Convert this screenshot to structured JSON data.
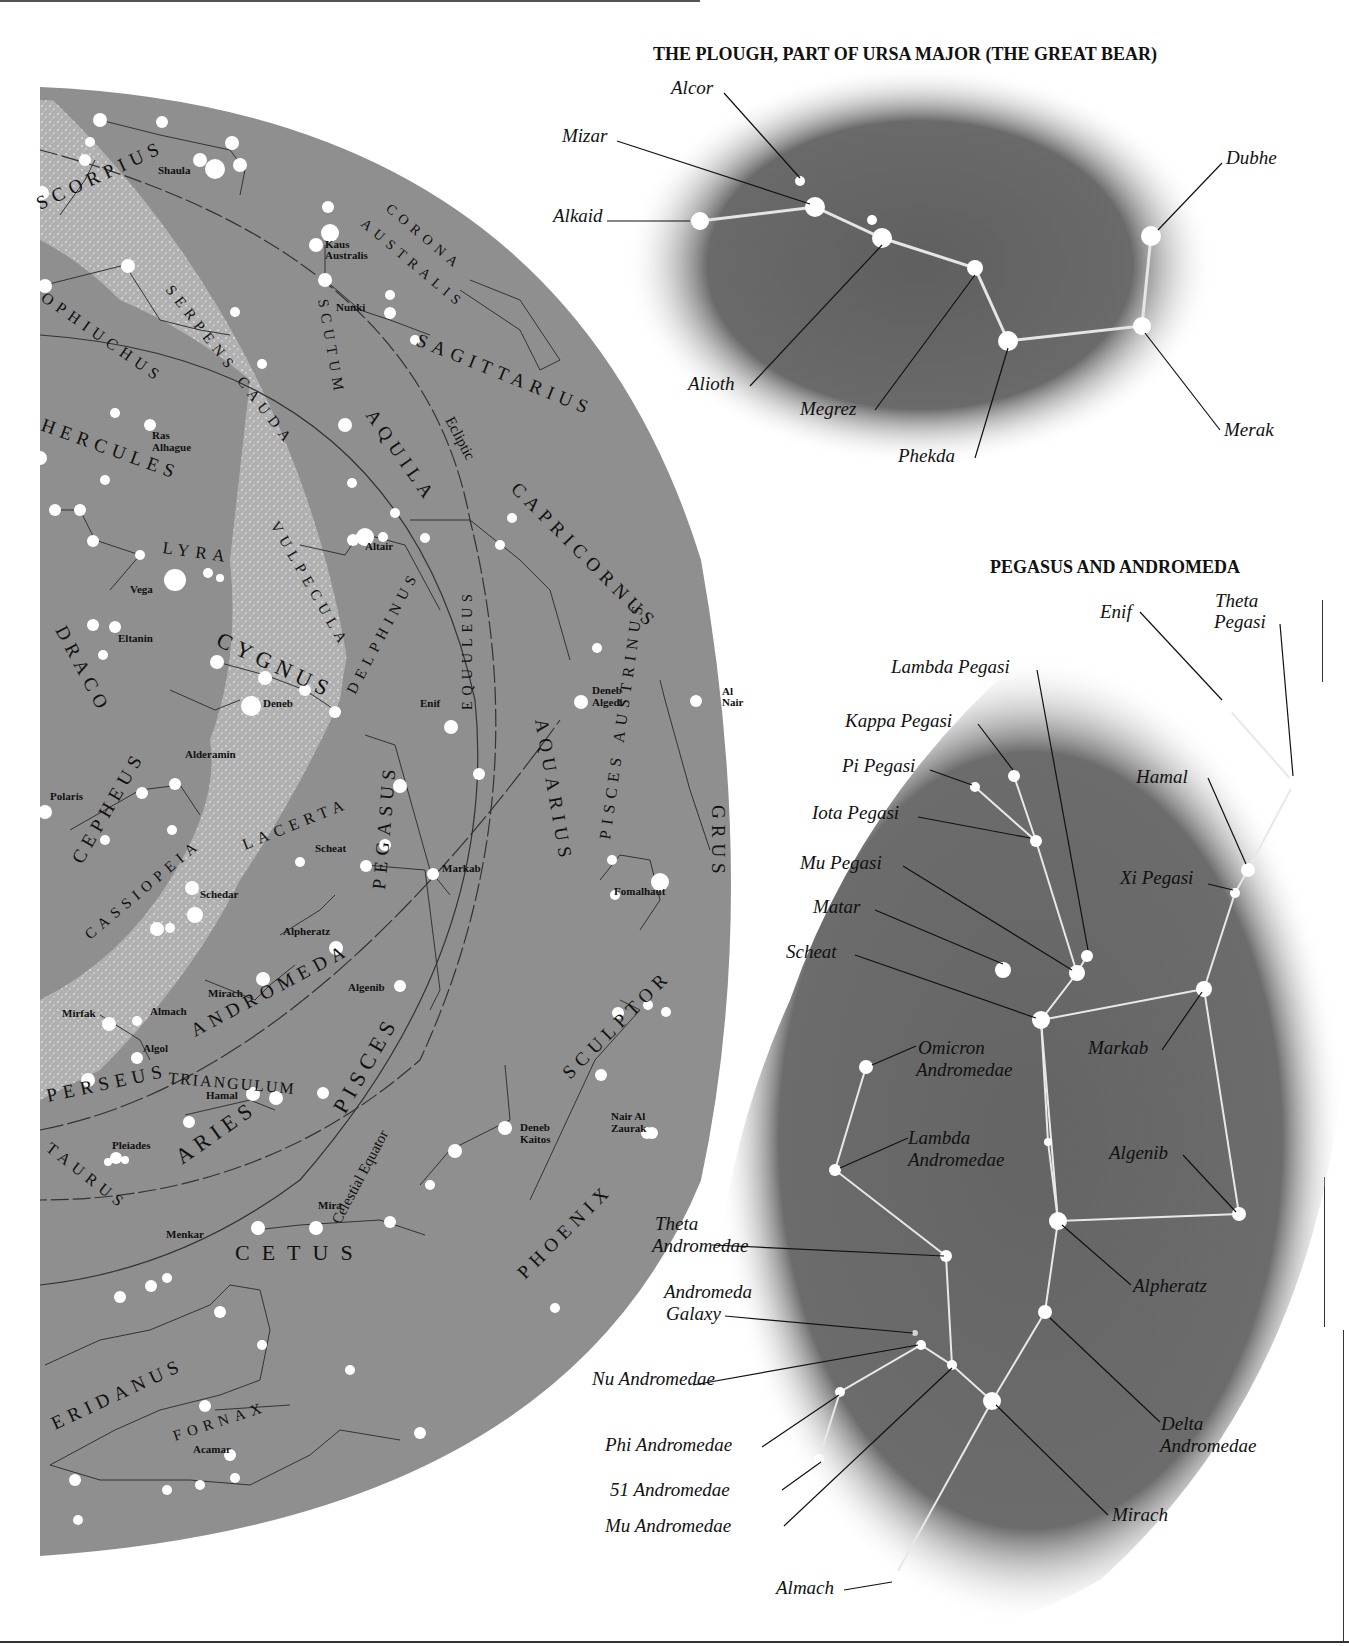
{
  "sky_map": {
    "background_color": "#8c8c8c",
    "milky_way_color": "#bdbdbd",
    "constellations": [
      {
        "name": "SCORPIUS",
        "x": 40,
        "y": 210,
        "rot": -25
      },
      {
        "name": "CORONA",
        "x": 385,
        "y": 210,
        "rot": 40
      },
      {
        "name": "AUSTRALIS",
        "x": 360,
        "y": 225,
        "rot": 40
      },
      {
        "name": "OPHIUCHUS",
        "x": 40,
        "y": 300,
        "rot": 35
      },
      {
        "name": "SERPENS CAUDA",
        "x": 165,
        "y": 290,
        "rot": 52
      },
      {
        "name": "SCUTUM",
        "x": 318,
        "y": 300,
        "rot": 80
      },
      {
        "name": "SAGITTARIUS",
        "x": 415,
        "y": 345,
        "rot": 22
      },
      {
        "name": "HERCULES",
        "x": 40,
        "y": 430,
        "rot": 20
      },
      {
        "name": "AQUILA",
        "x": 365,
        "y": 415,
        "rot": 55
      },
      {
        "name": "CAPRICORNUS",
        "x": 510,
        "y": 490,
        "rot": 45
      },
      {
        "name": "LYRA",
        "x": 162,
        "y": 553,
        "rot": 8
      },
      {
        "name": "VULPECULA",
        "x": 270,
        "y": 525,
        "rot": 60
      },
      {
        "name": "CYGNUS",
        "x": 215,
        "y": 645,
        "rot": 25
      },
      {
        "name": "DELPHINUS",
        "x": 355,
        "y": 695,
        "rot": -62
      },
      {
        "name": "EQUULEUS",
        "x": 472,
        "y": 710,
        "rot": -90
      },
      {
        "name": "DRACO",
        "x": 55,
        "y": 630,
        "rot": 62
      },
      {
        "name": "AQUARIUS",
        "x": 535,
        "y": 720,
        "rot": 80
      },
      {
        "name": "PISCES AUSTRINUS",
        "x": 610,
        "y": 840,
        "rot": -82
      },
      {
        "name": "GRUS",
        "x": 712,
        "y": 805,
        "rot": 90
      },
      {
        "name": "CEPHEUS",
        "x": 82,
        "y": 865,
        "rot": -60
      },
      {
        "name": "LACERTA",
        "x": 245,
        "y": 850,
        "rot": -22
      },
      {
        "name": "PEGASUS",
        "x": 385,
        "y": 890,
        "rot": -85
      },
      {
        "name": "CASSIOPEIA",
        "x": 90,
        "y": 940,
        "rot": -40
      },
      {
        "name": "ANDROMEDA",
        "x": 195,
        "y": 1037,
        "rot": -28
      },
      {
        "name": "PISCES",
        "x": 345,
        "y": 1115,
        "rot": -60
      },
      {
        "name": "SCULPTOR",
        "x": 570,
        "y": 1080,
        "rot": -45
      },
      {
        "name": "PERSEUS",
        "x": 48,
        "y": 1102,
        "rot": -12
      },
      {
        "name": "TRIANGULUM",
        "x": 168,
        "y": 1083,
        "rot": 5
      },
      {
        "name": "ARIES",
        "x": 182,
        "y": 1165,
        "rot": -35
      },
      {
        "name": "TAURUS",
        "x": 45,
        "y": 1150,
        "rot": 38
      },
      {
        "name": "PHOENIX",
        "x": 525,
        "y": 1280,
        "rot": -45
      },
      {
        "name": "CETUS",
        "x": 235,
        "y": 1260,
        "rot": 0
      },
      {
        "name": "ERIDANUS",
        "x": 55,
        "y": 1430,
        "rot": -25
      },
      {
        "name": "FORNAX",
        "x": 175,
        "y": 1441,
        "rot": -18
      }
    ],
    "star_labels": [
      {
        "name": "Shaula",
        "x": 158,
        "y": 174
      },
      {
        "name": "Kaus",
        "x": 325,
        "y": 248
      },
      {
        "name": "Australis",
        "x": 325,
        "y": 259
      },
      {
        "name": "Nunki",
        "x": 336,
        "y": 311
      },
      {
        "name": "Ras",
        "x": 152,
        "y": 439
      },
      {
        "name": "Alhague",
        "x": 152,
        "y": 451
      },
      {
        "name": "Altair",
        "x": 365,
        "y": 550
      },
      {
        "name": "Vega",
        "x": 130,
        "y": 593
      },
      {
        "name": "Eltanin",
        "x": 118,
        "y": 642
      },
      {
        "name": "Deneb",
        "x": 263,
        "y": 707
      },
      {
        "name": "Enif",
        "x": 420,
        "y": 707
      },
      {
        "name": "Deneb",
        "x": 592,
        "y": 694
      },
      {
        "name": "Algedi",
        "x": 592,
        "y": 706
      },
      {
        "name": "Al",
        "x": 722,
        "y": 695
      },
      {
        "name": "Nair",
        "x": 722,
        "y": 706
      },
      {
        "name": "Alderamin",
        "x": 185,
        "y": 758
      },
      {
        "name": "Polaris",
        "x": 50,
        "y": 800
      },
      {
        "name": "Scheat",
        "x": 315,
        "y": 852
      },
      {
        "name": "Markab",
        "x": 442,
        "y": 872
      },
      {
        "name": "Fomalhaut",
        "x": 614,
        "y": 895
      },
      {
        "name": "Schedar",
        "x": 200,
        "y": 898
      },
      {
        "name": "Alpheratz",
        "x": 283,
        "y": 935
      },
      {
        "name": "Mirach",
        "x": 208,
        "y": 997
      },
      {
        "name": "Algenib",
        "x": 348,
        "y": 991
      },
      {
        "name": "Mirfak",
        "x": 62,
        "y": 1017
      },
      {
        "name": "Almach",
        "x": 150,
        "y": 1015
      },
      {
        "name": "Algol",
        "x": 143,
        "y": 1052
      },
      {
        "name": "Hamal",
        "x": 206,
        "y": 1099
      },
      {
        "name": "Pleiades",
        "x": 112,
        "y": 1149
      },
      {
        "name": "Deneb",
        "x": 520,
        "y": 1131
      },
      {
        "name": "Kaitos",
        "x": 520,
        "y": 1143
      },
      {
        "name": "Nair Al",
        "x": 611,
        "y": 1120
      },
      {
        "name": "Zaurak",
        "x": 611,
        "y": 1132
      },
      {
        "name": "Mira",
        "x": 318,
        "y": 1209
      },
      {
        "name": "Menkar",
        "x": 166,
        "y": 1238
      },
      {
        "name": "Acamar",
        "x": 193,
        "y": 1453
      }
    ],
    "reference_lines": {
      "ecliptic": "Ecliptic",
      "celestial_equator": "Celestial Equator"
    }
  },
  "plough": {
    "title": "THE PLOUGH, PART OF URSA MAJOR (THE GREAT BEAR)",
    "stars": [
      {
        "name": "Alcor",
        "lx": 671,
        "ly": 94
      },
      {
        "name": "Mizar",
        "lx": 562,
        "ly": 142
      },
      {
        "name": "Alkaid",
        "lx": 553,
        "ly": 222
      },
      {
        "name": "Dubhe",
        "lx": 1226,
        "ly": 164
      },
      {
        "name": "Alioth",
        "lx": 688,
        "ly": 390
      },
      {
        "name": "Megrez",
        "lx": 800,
        "ly": 415
      },
      {
        "name": "Phekda",
        "lx": 898,
        "ly": 462
      },
      {
        "name": "Merak",
        "lx": 1224,
        "ly": 436
      }
    ]
  },
  "pegasus_andromeda": {
    "title": "PEGASUS AND ANDROMEDA",
    "labels": [
      {
        "name": "Enif",
        "lx": 1100,
        "ly": 618
      },
      {
        "name": "Theta",
        "lx": 1215,
        "ly": 607
      },
      {
        "name": "Pegasi",
        "lx": 1214,
        "ly": 628
      },
      {
        "name": "Lambda Pegasi",
        "lx": 891,
        "ly": 673
      },
      {
        "name": "Kappa Pegasi",
        "lx": 845,
        "ly": 727
      },
      {
        "name": "Pi Pegasi",
        "lx": 842,
        "ly": 772
      },
      {
        "name": "Iota Pegasi",
        "lx": 812,
        "ly": 819
      },
      {
        "name": "Hamal",
        "lx": 1136,
        "ly": 783
      },
      {
        "name": "Mu Pegasi",
        "lx": 800,
        "ly": 869
      },
      {
        "name": "Xi Pegasi",
        "lx": 1120,
        "ly": 884
      },
      {
        "name": "Matar",
        "lx": 813,
        "ly": 913
      },
      {
        "name": "Scheat",
        "lx": 786,
        "ly": 958
      },
      {
        "name": "Markab",
        "lx": 1088,
        "ly": 1054
      },
      {
        "name": "Omicron",
        "lx": 918,
        "ly": 1054
      },
      {
        "name": "Andromedae",
        "lx": 916,
        "ly": 1076
      },
      {
        "name": "Lambda",
        "lx": 908,
        "ly": 1144
      },
      {
        "name": "Andromedae",
        "lx": 908,
        "ly": 1166
      },
      {
        "name": "Algenib",
        "lx": 1109,
        "ly": 1159
      },
      {
        "name": "Theta",
        "lx": 655,
        "ly": 1230
      },
      {
        "name": "Andromedae",
        "lx": 652,
        "ly": 1252
      },
      {
        "name": "Alpheratz",
        "lx": 1133,
        "ly": 1292
      },
      {
        "name": "Andromeda",
        "lx": 664,
        "ly": 1298
      },
      {
        "name": "Galaxy",
        "lx": 666,
        "ly": 1320
      },
      {
        "name": "Nu Andromedae",
        "lx": 592,
        "ly": 1385
      },
      {
        "name": "Delta",
        "lx": 1161,
        "ly": 1430
      },
      {
        "name": "Phi Andromedae",
        "lx": 605,
        "ly": 1451
      },
      {
        "name": "Andromedae",
        "lx": 1160,
        "ly": 1452
      },
      {
        "name": "51 Andromedae",
        "lx": 610,
        "ly": 1496
      },
      {
        "name": "Mirach",
        "lx": 1112,
        "ly": 1521
      },
      {
        "name": "Mu Andromedae",
        "lx": 605,
        "ly": 1532
      },
      {
        "name": "Almach",
        "lx": 776,
        "ly": 1594
      }
    ]
  }
}
